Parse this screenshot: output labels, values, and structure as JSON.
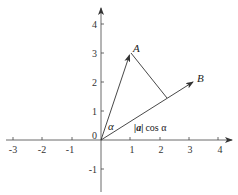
{
  "diagram": {
    "type": "vector-projection",
    "x_axis": {
      "ticks": [
        "-3",
        "-2",
        "-1",
        "1",
        "2",
        "3",
        "4"
      ]
    },
    "y_axis": {
      "ticks": [
        "-1",
        "1",
        "2",
        "3",
        "4"
      ]
    },
    "origin_label": "0",
    "points": {
      "A": {
        "label": "A",
        "coords": [
          1,
          3
        ]
      },
      "B": {
        "label": "B"
      }
    },
    "angle_label": "α",
    "projection_label": {
      "norm": "|a|",
      "rest": "cos α"
    },
    "colors": {
      "line": "#333333",
      "axis": "#444444",
      "background": "#ffffff"
    }
  }
}
